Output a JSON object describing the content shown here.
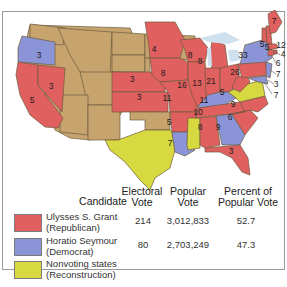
{
  "colors": {
    "republican": "#e06060",
    "democrat": "#8b94d6",
    "nonvoting": "#d8d840",
    "territory": "#c7a46e",
    "water": "#cfe0ee",
    "border": "#6b5a3e"
  },
  "map_labels": {
    "oregon": "3",
    "nevada": "3",
    "california": "5",
    "nebraska": "3",
    "kansas": "3",
    "minnesota": "4",
    "iowa": "8",
    "missouri": "11",
    "arkansas": "5",
    "louisiana": "7",
    "wisconsin": "8",
    "illinois": "16",
    "michigan": "8",
    "indiana": "13",
    "ohio": "21",
    "kentucky": "11",
    "tennessee": "10",
    "alabama": "8",
    "georgia": "9",
    "florida": "3",
    "south_carolina": "6",
    "north_carolina": "9",
    "west_virginia": "5",
    "pennsylvania": "26",
    "new_york": "33",
    "vermont": "5",
    "new_hampshire": "5",
    "maine": "7",
    "massachusetts": "12",
    "rhode_island": "4",
    "connecticut": "6",
    "new_jersey": "7",
    "delaware": "3",
    "maryland": "7"
  },
  "table": {
    "headers": {
      "candidate": "Candidate",
      "electoral_1": "Electoral",
      "electoral_2": "Vote",
      "popular_1": "Popular",
      "popular_2": "Vote",
      "percent_1": "Percent of",
      "percent_2": "Popular Vote"
    },
    "rows": [
      {
        "name": "Ulysses S. Grant",
        "party": "(Republican)",
        "electoral": "214",
        "popular": "3,012,833",
        "percent": "52.7",
        "color": "#e06060"
      },
      {
        "name": "Horatio Seymour",
        "party": "(Democrat)",
        "electoral": "80",
        "popular": "2,703,249",
        "percent": "47.3",
        "color": "#8b94d6"
      },
      {
        "name": "Nonvoting states",
        "party": "(Reconstruction)",
        "electoral": "",
        "popular": "",
        "percent": "",
        "color": "#d8d840"
      }
    ]
  }
}
